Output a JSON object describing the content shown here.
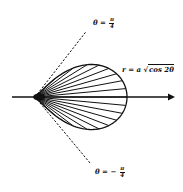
{
  "diagram": {
    "title": "",
    "curve_label": {
      "lhs": "r = a",
      "radical": "√",
      "radicand": "cos 2θ"
    },
    "upper_line_label": {
      "lhs": "θ =",
      "num": "π",
      "den": "4"
    },
    "lower_line_label": {
      "lhs": "θ = −",
      "num": "π",
      "den": "4"
    },
    "origin": {
      "x": 35,
      "y": 97
    },
    "a": 92,
    "axis": {
      "x_start": 12,
      "x_end": 175,
      "y": 97
    },
    "ray_count": 17,
    "colors": {
      "stroke": "#111111",
      "background": "#ffffff"
    }
  }
}
